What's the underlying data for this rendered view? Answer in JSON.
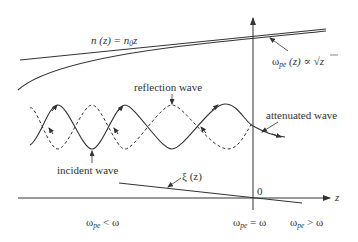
{
  "labels": {
    "n_profile": "n (z) = n",
    "n_profile_sub": "0",
    "n_profile_tail": "z",
    "omega_profile_pre": "ω",
    "omega_profile_sub": "pe",
    "omega_profile_post": " (z) ∝ √z",
    "reflection_wave": "reflection wave",
    "attenuated_wave": "attenuated wave",
    "incident_wave": "incident wave",
    "xi": "ξ (z)",
    "origin": "0",
    "z_axis": "z",
    "region_left_pre": "ω",
    "region_left_sub": "pe",
    "region_left_post": " < ω",
    "region_mid_pre": "ω",
    "region_mid_sub": "pe",
    "region_mid_post": " = ω",
    "region_right_pre": "ω",
    "region_right_sub": "pe",
    "region_right_post": " > ω"
  },
  "colors": {
    "line": "#333333",
    "background": "#ffffff"
  }
}
